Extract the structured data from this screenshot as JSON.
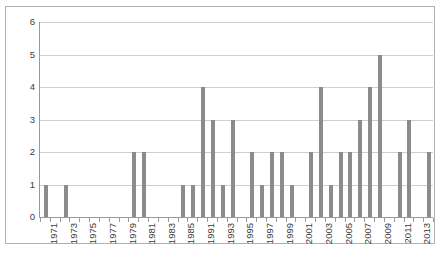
{
  "chart_data": {
    "type": "bar",
    "title": "",
    "subtitle": "",
    "xlabel": "",
    "ylabel": "",
    "ylim": [
      0,
      6
    ],
    "ytick_labels": [
      "0",
      "1",
      "2",
      "3",
      "4",
      "5",
      "6"
    ],
    "ytick_values": [
      0,
      1,
      2,
      3,
      4,
      5,
      6
    ],
    "grid": true,
    "legend": false,
    "legend_position": "none",
    "bar_color": "#8c8c8c",
    "gridline_color": "#cfcfcf",
    "axis_color": "#9a9a9a",
    "frame_color": "#b0b0b0",
    "background_color": "#ffffff",
    "categories": [
      "1971",
      "1972",
      "1973",
      "1974",
      "1975",
      "1976",
      "1977",
      "1978",
      "1979",
      "1980",
      "1981",
      "1982",
      "1983",
      "1984",
      "1985",
      "1986",
      "1991",
      "1992",
      "1993",
      "1994",
      "1995",
      "1996",
      "1997",
      "1998",
      "1999",
      "2000",
      "2001",
      "2002",
      "2003",
      "2004",
      "2005",
      "2006",
      "2007",
      "2008",
      "2009",
      "2010",
      "2011",
      "2012",
      "2013",
      "2014"
    ],
    "values": [
      1,
      0,
      1,
      0,
      0,
      0,
      0,
      0,
      0,
      2,
      2,
      0,
      0,
      0,
      1,
      1,
      4,
      3,
      1,
      3,
      0,
      2,
      1,
      2,
      2,
      1,
      0,
      2,
      4,
      1,
      2,
      2,
      3,
      4,
      5,
      0,
      2,
      3,
      0,
      2
    ],
    "visible_tick_labels": [
      "1971",
      "1973",
      "1975",
      "1977",
      "1979",
      "1981",
      "1983",
      "1985",
      "1991",
      "1993",
      "1995",
      "1997",
      "1999",
      "2001",
      "2003",
      "2005",
      "2007",
      "2009",
      "2011",
      "2013"
    ],
    "visible_tick_label_indices": [
      0,
      2,
      4,
      6,
      8,
      10,
      12,
      14,
      16,
      18,
      20,
      22,
      24,
      26,
      28,
      30,
      32,
      34,
      36,
      38
    ],
    "annotations": []
  }
}
